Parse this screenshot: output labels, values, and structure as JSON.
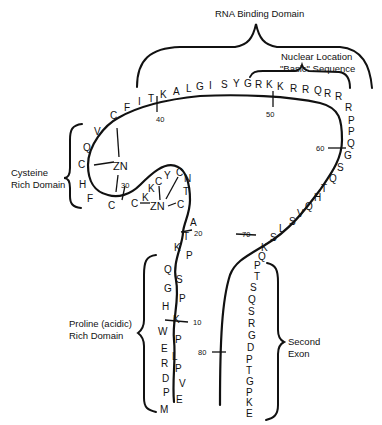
{
  "labels": {
    "rna_binding": "RNA Binding Domain",
    "nuclear_line1": "Nuclear Location",
    "nuclear_line2": "\"Basic\" Sequence",
    "cysteine_line1": "Cysteine",
    "cysteine_line2": "Rich Domain",
    "proline_line1": "Proline (acidic)",
    "proline_line2": "Rich Domain",
    "exon_line1": "Second",
    "exon_line2": "Exon",
    "zn": "ZN"
  },
  "position_markers": [
    "10",
    "20",
    "30",
    "40",
    "50",
    "60",
    "70",
    "80"
  ],
  "sequence": {
    "proline_rich": [
      "M",
      "E",
      "P",
      "V",
      "D",
      "P",
      "R",
      "L",
      "E",
      "P",
      "W",
      "K",
      "H",
      "P",
      "G",
      "S",
      "Q",
      "P",
      "K",
      "T"
    ],
    "cysteine_rich": [
      "A",
      "C",
      "T",
      "N",
      "C",
      "Y",
      "C",
      "K",
      "K",
      "C",
      "C",
      "F",
      "H",
      "C",
      "Q",
      "V",
      "C",
      "F",
      "I",
      "T"
    ],
    "basic_region": [
      "K",
      "A",
      "L",
      "G",
      "I",
      "S",
      "Y",
      "G",
      "R",
      "K",
      "K",
      "R",
      "R",
      "Q",
      "R",
      "R",
      "R",
      "P",
      "P",
      "Q"
    ],
    "second_half": [
      "G",
      "S",
      "Q",
      "T",
      "H",
      "Q",
      "V",
      "S",
      "L",
      "S",
      "K",
      "Q",
      "P",
      "T",
      "S",
      "Q",
      "S",
      "R",
      "G",
      "D",
      "P",
      "T",
      "G",
      "P",
      "K",
      "E"
    ]
  }
}
